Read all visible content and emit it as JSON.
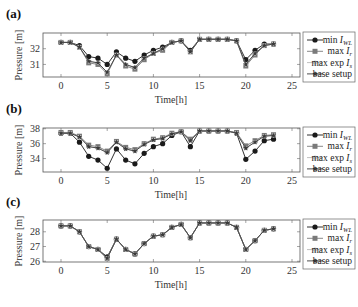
{
  "figure": {
    "panels": [
      "(a)",
      "(b)",
      "(c)"
    ],
    "xlabel": "Time[h]",
    "ylabel": "Pressure [m]",
    "legend": [
      {
        "label": "min I_WL",
        "main": "min ",
        "var": "I",
        "sub": "WL",
        "marker": "circle",
        "color": "#1a1a1a"
      },
      {
        "label": "max I_r",
        "main": "max ",
        "var": "I",
        "sub": "r",
        "marker": "square",
        "color": "#7a7a7a"
      },
      {
        "label": "max exp I_s",
        "main": "max exp ",
        "var": "I",
        "sub": "s",
        "marker": "circle-light",
        "color": "#c8c8c8"
      },
      {
        "label": "base setup",
        "main": "base setup",
        "var": "",
        "sub": "",
        "marker": "star",
        "color": "#444444"
      }
    ]
  },
  "chart_data": [
    {
      "type": "line",
      "title": "(a)",
      "xlabel": "Time[h]",
      "ylabel": "Pressure [m]",
      "xlim": [
        -2,
        25
      ],
      "ylim": [
        30.2,
        33.0
      ],
      "xticks": [
        0,
        5,
        10,
        15,
        20,
        25
      ],
      "yticks": [
        31,
        32
      ],
      "grid": false,
      "legend_position": "right, outside",
      "x": [
        0,
        1,
        2,
        3,
        4,
        5,
        6,
        7,
        8,
        9,
        10,
        11,
        12,
        13,
        14,
        15,
        16,
        17,
        18,
        19,
        20,
        21,
        22,
        23
      ],
      "series": [
        {
          "name": "min I_WL",
          "values": [
            32.4,
            32.4,
            32.2,
            31.5,
            31.4,
            31.0,
            31.8,
            31.4,
            31.2,
            31.6,
            31.9,
            32.1,
            32.4,
            32.5,
            31.9,
            32.6,
            32.6,
            32.6,
            32.6,
            32.5,
            31.3,
            31.9,
            32.3,
            32.3
          ]
        },
        {
          "name": "max I_r",
          "values": [
            32.4,
            32.4,
            32.1,
            31.1,
            31.0,
            30.4,
            31.6,
            30.9,
            30.7,
            31.3,
            31.7,
            31.9,
            32.4,
            32.5,
            31.8,
            32.6,
            32.6,
            32.6,
            32.6,
            32.5,
            30.9,
            31.6,
            32.2,
            32.3
          ]
        },
        {
          "name": "max exp I_s",
          "values": [
            32.4,
            32.4,
            32.1,
            31.2,
            31.1,
            30.5,
            31.6,
            31.0,
            30.8,
            31.4,
            31.7,
            32.0,
            32.4,
            32.5,
            31.8,
            32.6,
            32.6,
            32.6,
            32.6,
            32.5,
            31.0,
            31.7,
            32.2,
            32.3
          ]
        },
        {
          "name": "base setup",
          "values": [
            32.4,
            32.4,
            32.1,
            31.2,
            31.1,
            30.5,
            31.6,
            31.0,
            30.8,
            31.4,
            31.7,
            32.0,
            32.4,
            32.5,
            31.8,
            32.6,
            32.6,
            32.6,
            32.6,
            32.5,
            31.0,
            31.7,
            32.2,
            32.3
          ]
        }
      ]
    },
    {
      "type": "line",
      "title": "(b)",
      "xlabel": "Time[h]",
      "ylabel": "Pressure [m]",
      "xlim": [
        -2,
        25
      ],
      "ylim": [
        32.2,
        38.1
      ],
      "xticks": [
        0,
        5,
        10,
        15,
        20,
        25
      ],
      "yticks": [
        34,
        36,
        38
      ],
      "grid": false,
      "legend_position": "right, outside",
      "x": [
        0,
        1,
        2,
        3,
        4,
        5,
        6,
        7,
        8,
        9,
        10,
        11,
        12,
        13,
        14,
        15,
        16,
        17,
        18,
        19,
        20,
        21,
        22,
        23
      ],
      "series": [
        {
          "name": "min I_WL",
          "values": [
            37.4,
            37.4,
            36.2,
            34.3,
            33.8,
            32.7,
            35.3,
            33.8,
            33.3,
            34.7,
            35.6,
            36.0,
            37.1,
            37.6,
            35.6,
            37.7,
            37.7,
            37.7,
            37.7,
            37.4,
            33.9,
            35.0,
            36.4,
            36.6
          ]
        },
        {
          "name": "max I_r",
          "values": [
            37.5,
            37.5,
            37.0,
            35.8,
            35.6,
            35.0,
            36.3,
            35.5,
            35.2,
            36.0,
            36.6,
            36.8,
            37.4,
            37.6,
            36.6,
            37.7,
            37.7,
            37.7,
            37.7,
            37.5,
            35.7,
            36.4,
            37.1,
            37.2
          ]
        },
        {
          "name": "max exp I_s",
          "values": [
            37.4,
            37.4,
            36.9,
            35.6,
            35.4,
            34.8,
            36.2,
            35.3,
            35.0,
            35.9,
            36.5,
            36.7,
            37.3,
            37.6,
            36.4,
            37.7,
            37.7,
            37.7,
            37.7,
            37.4,
            35.4,
            36.2,
            37.0,
            37.1
          ]
        },
        {
          "name": "base setup",
          "values": [
            37.4,
            37.4,
            36.9,
            35.6,
            35.4,
            34.8,
            36.2,
            35.3,
            35.0,
            35.9,
            36.5,
            36.7,
            37.3,
            37.6,
            36.4,
            37.7,
            37.7,
            37.7,
            37.7,
            37.4,
            35.4,
            36.2,
            37.0,
            37.1
          ]
        }
      ]
    },
    {
      "type": "line",
      "title": "(c)",
      "xlabel": "Time[h]",
      "ylabel": "Pressure [m]",
      "xlim": [
        -2,
        25
      ],
      "ylim": [
        25.95,
        28.8
      ],
      "xticks": [
        0,
        5,
        10,
        15,
        20,
        25
      ],
      "yticks": [
        26,
        27,
        28
      ],
      "grid": false,
      "legend_position": "right, outside",
      "x": [
        0,
        1,
        2,
        3,
        4,
        5,
        6,
        7,
        8,
        9,
        10,
        11,
        12,
        13,
        14,
        15,
        16,
        17,
        18,
        19,
        20,
        21,
        22,
        23
      ],
      "series": [
        {
          "name": "min I_WL",
          "values": [
            28.4,
            28.4,
            28.0,
            27.0,
            26.8,
            26.3,
            27.5,
            26.8,
            26.5,
            27.2,
            27.7,
            27.8,
            28.3,
            28.5,
            27.6,
            28.6,
            28.6,
            28.6,
            28.6,
            28.3,
            26.8,
            27.4,
            28.1,
            28.2
          ]
        },
        {
          "name": "max I_r",
          "values": [
            28.4,
            28.4,
            28.0,
            27.0,
            26.8,
            26.2,
            27.5,
            26.8,
            26.5,
            27.2,
            27.7,
            27.8,
            28.3,
            28.5,
            27.6,
            28.6,
            28.6,
            28.6,
            28.6,
            28.3,
            26.8,
            27.4,
            28.1,
            28.2
          ]
        },
        {
          "name": "max exp I_s",
          "values": [
            28.4,
            28.4,
            28.0,
            27.0,
            26.8,
            26.2,
            27.5,
            26.8,
            26.5,
            27.2,
            27.7,
            27.8,
            28.3,
            28.5,
            27.6,
            28.6,
            28.6,
            28.6,
            28.6,
            28.3,
            26.8,
            27.4,
            28.1,
            28.2
          ]
        },
        {
          "name": "base setup",
          "values": [
            28.4,
            28.4,
            28.0,
            27.0,
            26.8,
            26.2,
            27.5,
            26.8,
            26.5,
            27.2,
            27.7,
            27.8,
            28.3,
            28.5,
            27.6,
            28.6,
            28.6,
            28.6,
            28.6,
            28.3,
            26.8,
            27.4,
            28.1,
            28.2
          ]
        }
      ]
    }
  ]
}
